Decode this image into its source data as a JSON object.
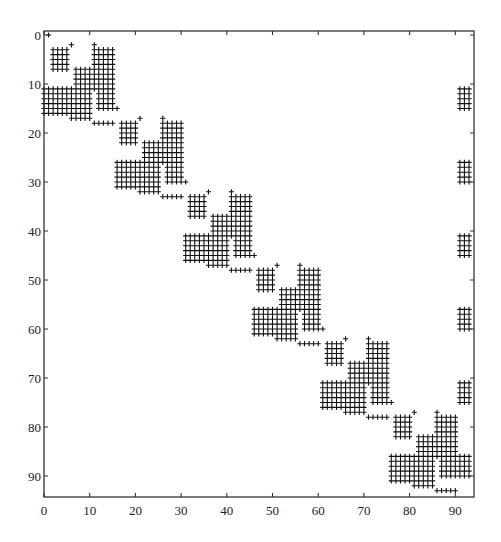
{
  "chart_data": {
    "type": "scatter",
    "subtype": "sparsity-pattern",
    "title": "",
    "xlabel": "",
    "ylabel": "",
    "marker": "+",
    "marker_color": "#111111",
    "xlim": [
      0,
      94
    ],
    "ylim": [
      94,
      0
    ],
    "grid": false,
    "legend": null,
    "x_ticks": [
      0,
      10,
      20,
      30,
      40,
      50,
      60,
      70,
      80,
      90
    ],
    "y_ticks": [
      0,
      10,
      20,
      30,
      40,
      50,
      60,
      70,
      80,
      90
    ],
    "x_tick_labels": [
      "0",
      "10",
      "20",
      "30",
      "40",
      "50",
      "60",
      "70",
      "80",
      "90"
    ],
    "y_tick_labels": [
      "0",
      "10",
      "20",
      "30",
      "40",
      "50",
      "60",
      "70",
      "80",
      "90"
    ],
    "matrix_size": 94,
    "block_offsets": [
      0,
      15,
      30,
      45,
      60,
      75
    ],
    "block_template": [
      {
        "rows": [
          0,
          0
        ],
        "cols": [
          1,
          1
        ]
      },
      {
        "rows": [
          2,
          2
        ],
        "cols": [
          6,
          6
        ]
      },
      {
        "rows": [
          2,
          2
        ],
        "cols": [
          11,
          11
        ]
      },
      {
        "rows": [
          3,
          7
        ],
        "cols": [
          2,
          5
        ]
      },
      {
        "rows": [
          3,
          11
        ],
        "cols": [
          11,
          15
        ]
      },
      {
        "rows": [
          12,
          15
        ],
        "cols": [
          12,
          15
        ]
      },
      {
        "rows": [
          7,
          16
        ],
        "cols": [
          7,
          10
        ]
      },
      {
        "rows": [
          11,
          16
        ],
        "cols": [
          1,
          6
        ]
      },
      {
        "rows": [
          15,
          15
        ],
        "cols": [
          16,
          16
        ]
      },
      {
        "rows": [
          17,
          17
        ],
        "cols": [
          6,
          10
        ]
      },
      {
        "rows": [
          18,
          18
        ],
        "cols": [
          11,
          15
        ]
      }
    ],
    "extra_blocks": [
      {
        "rows": [
          11,
          16
        ],
        "cols": [
          0,
          0
        ]
      },
      {
        "rows": [
          11,
          15
        ],
        "cols": [
          91,
          93
        ]
      },
      {
        "rows": [
          26,
          30
        ],
        "cols": [
          91,
          93
        ]
      },
      {
        "rows": [
          41,
          45
        ],
        "cols": [
          91,
          93
        ]
      },
      {
        "rows": [
          56,
          60
        ],
        "cols": [
          91,
          93
        ]
      },
      {
        "rows": [
          71,
          75
        ],
        "cols": [
          91,
          93
        ]
      },
      {
        "rows": [
          86,
          90
        ],
        "cols": [
          91,
          93
        ]
      }
    ]
  }
}
